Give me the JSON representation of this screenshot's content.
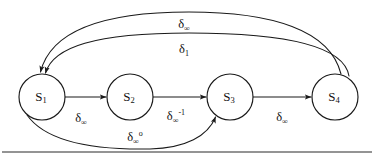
{
  "figure": {
    "type": "state-transition-diagram",
    "background_color": "#ffffff",
    "stroke_color": "#1a1a1a",
    "text_color": "#111111",
    "width": 374,
    "height": 164
  },
  "nodes": [
    {
      "id": "s1",
      "base": "S",
      "subscript": "1",
      "label": "S1",
      "cx": 42,
      "cy": 97,
      "r": 23
    },
    {
      "id": "s2",
      "base": "S",
      "subscript": "2",
      "label": "S2",
      "cx": 130,
      "cy": 97,
      "r": 23
    },
    {
      "id": "s3",
      "base": "S",
      "subscript": "3",
      "label": "S3",
      "cx": 230,
      "cy": 97,
      "r": 23
    },
    {
      "id": "s4",
      "base": "S",
      "subscript": "4",
      "label": "S4",
      "cx": 335,
      "cy": 97,
      "r": 23
    }
  ],
  "edges": [
    {
      "id": "e-s1-s2",
      "from": "s1",
      "to": "s2",
      "shape": "straight",
      "label": {
        "base": "δ",
        "subscript": "∞",
        "superscript": "",
        "text": "δ∞",
        "x": 81,
        "y": 122
      }
    },
    {
      "id": "e-s2-s3",
      "from": "s2",
      "to": "s3",
      "shape": "straight",
      "label": {
        "base": "δ",
        "subscript": "∞",
        "superscript": "-1",
        "text": "δ∞-1",
        "x": 176,
        "y": 120
      }
    },
    {
      "id": "e-s3-s4",
      "from": "s3",
      "to": "s4",
      "shape": "straight",
      "label": {
        "base": "δ",
        "subscript": "∞",
        "superscript": "",
        "text": "δ∞",
        "x": 282,
        "y": 121
      }
    },
    {
      "id": "e-s4-s1-outer",
      "from": "s4",
      "to": "s1",
      "shape": "arc-top-outer",
      "label": {
        "base": "δ",
        "subscript": "∞",
        "superscript": "",
        "text": "δ∞",
        "x": 184,
        "y": 28
      }
    },
    {
      "id": "e-s4-s1-inner",
      "from": "s4",
      "to": "s1",
      "shape": "arc-top-inner",
      "label": {
        "base": "δ",
        "subscript": "1",
        "superscript": "",
        "text": "δ1",
        "x": 184,
        "y": 53
      }
    },
    {
      "id": "e-s1-s3-bottom",
      "from": "s1",
      "to": "s3",
      "shape": "arc-bottom",
      "label": {
        "base": "δ",
        "subscript": "∞",
        "superscript": "o",
        "text": "δ∞o",
        "x": 135,
        "y": 141
      }
    }
  ],
  "rule": {
    "id": "bottom-rule",
    "x1": 2,
    "x2": 372,
    "y": 152
  }
}
